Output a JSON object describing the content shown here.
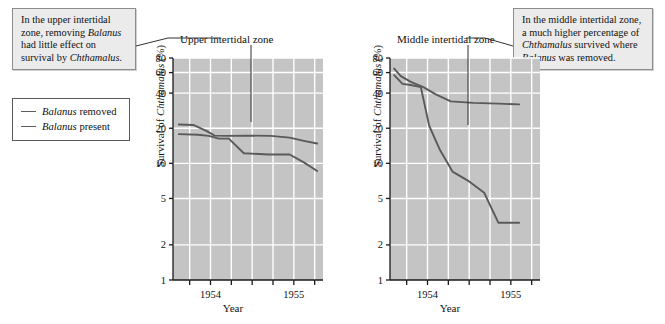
{
  "callouts": {
    "left": {
      "name": "upper-zone-callout",
      "lines": [
        {
          "text": "In the upper intertidal",
          "italic": null
        },
        {
          "text": "zone, removing ",
          "italic": "Balanus"
        },
        {
          "text": "had little effect on",
          "italic": null
        },
        {
          "text": "survival by ",
          "italic": "Chthamalus."
        }
      ],
      "plain": "In the upper intertidal zone, removing Balanus had little effect on survival by Chthamalus."
    },
    "right": {
      "name": "middle-zone-callout",
      "lines": [
        {
          "text": "In the middle intertidal zone,",
          "italic": null
        },
        {
          "text": "a much higher percentage of",
          "italic": null
        },
        {
          "text": "",
          "italic": "Chthamalus",
          "after": " survived where"
        },
        {
          "text": "",
          "italic": "Balanus",
          "after": " was removed."
        }
      ],
      "plain": "In the middle intertidal zone, a much higher percentage of Chthamalus survived where Balanus was removed."
    }
  },
  "legend": {
    "title": "legend",
    "entries": [
      {
        "species": "Balanus",
        "label": " removed",
        "color": "#5c5c5c",
        "series_key": "removed"
      },
      {
        "species": "Balanus",
        "label": " present",
        "color": "#5c5c5c",
        "series_key": "present"
      }
    ]
  },
  "colors": {
    "plot_background": "#c4c4c4",
    "gridline": "#ffffff",
    "line": "#5a5a5a",
    "axis": "#1a1a1a",
    "callout_background": "#ebebeb",
    "callout_border": "#8c8c8c"
  },
  "chart_data": [
    {
      "type": "line",
      "panel": "left",
      "title": "Upper intertidal zone",
      "xlabel": "Year",
      "ylabel": "Survival of Chthamalus (%)",
      "ylabel_italic": "Chthamalus",
      "yscale": "log",
      "ylim": [
        1,
        80
      ],
      "yticks": [
        80,
        60,
        40,
        20,
        10,
        5,
        2,
        1
      ],
      "ytick_labels": [
        "80",
        "60",
        "40",
        "20",
        "10",
        "5",
        "2",
        "1"
      ],
      "xlim": [
        1953.55,
        1955.35
      ],
      "xticks": [
        1953.75,
        1954.0,
        1954.25,
        1954.5,
        1954.75,
        1955.0,
        1955.25
      ],
      "xtick_labels": [
        "",
        "1954",
        "",
        "",
        "",
        "1955",
        ""
      ],
      "xtick_labeled": [
        1954,
        1955
      ],
      "grid": true,
      "legend_position": "external-left",
      "series": [
        {
          "name": "Balanus removed",
          "x": [
            1953.62,
            1953.8,
            1953.95,
            1954.05,
            1954.2,
            1954.45,
            1954.72,
            1954.95,
            1955.12,
            1955.28
          ],
          "values": [
            21.5,
            21.3,
            19.0,
            17.3,
            17.2,
            17.3,
            17.2,
            16.6,
            15.6,
            14.8
          ]
        },
        {
          "name": "Balanus present",
          "x": [
            1953.62,
            1953.85,
            1953.98,
            1954.1,
            1954.22,
            1954.4,
            1954.7,
            1954.95,
            1955.12,
            1955.28
          ],
          "values": [
            17.8,
            17.6,
            17.2,
            16.3,
            16.3,
            12.2,
            11.9,
            11.9,
            10.2,
            8.6
          ]
        }
      ]
    },
    {
      "type": "line",
      "panel": "right",
      "title": "Middle intertidal zone",
      "xlabel": "Year",
      "ylabel": "Survival of Chthamalus (%)",
      "ylabel_italic": "Chthamalus",
      "yscale": "log",
      "ylim": [
        1,
        80
      ],
      "yticks": [
        80,
        60,
        40,
        20,
        10,
        5,
        2,
        1
      ],
      "ytick_labels": [
        "80",
        "60",
        "40",
        "20",
        "10",
        "5",
        "2",
        "1"
      ],
      "xlim": [
        1953.55,
        1955.35
      ],
      "xticks": [
        1953.75,
        1954.0,
        1954.25,
        1954.5,
        1954.75,
        1955.0,
        1955.25
      ],
      "xtick_labels": [
        "",
        "1954",
        "",
        "",
        "",
        "1955",
        ""
      ],
      "xtick_labeled": [
        1954,
        1955
      ],
      "grid": true,
      "legend_position": "external-left",
      "series": [
        {
          "name": "Balanus removed",
          "x": [
            1953.6,
            1953.68,
            1953.8,
            1953.95,
            1954.1,
            1954.28,
            1954.55,
            1954.85,
            1955.1
          ],
          "values": [
            65.0,
            56.0,
            50.0,
            45.0,
            39.0,
            34.0,
            33.0,
            32.5,
            32.0
          ]
        },
        {
          "name": "Balanus present",
          "x": [
            1953.6,
            1953.7,
            1953.8,
            1953.92,
            1954.02,
            1954.15,
            1954.3,
            1954.5,
            1954.68,
            1954.85,
            1955.1
          ],
          "values": [
            57.0,
            48.0,
            47.0,
            45.0,
            21.0,
            13.0,
            8.5,
            7.0,
            5.6,
            3.1,
            3.1
          ]
        }
      ]
    }
  ]
}
